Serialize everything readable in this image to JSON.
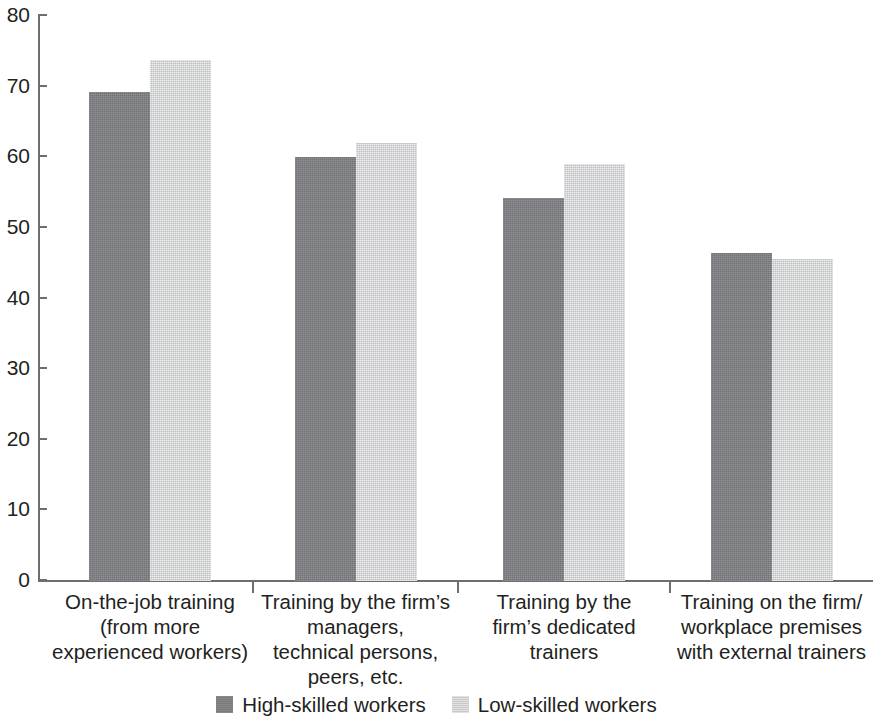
{
  "chart_data": {
    "type": "bar",
    "title": "",
    "subtitle": "",
    "xlabel": "",
    "ylabel": "",
    "ylim": [
      0,
      80
    ],
    "ytick_labels": [
      "80",
      "70",
      "60",
      "50",
      "40",
      "30",
      "20",
      "10",
      "0"
    ],
    "yticks": [
      80,
      70,
      60,
      50,
      40,
      30,
      20,
      10,
      0
    ],
    "grid": false,
    "legend_position": "bottom-center",
    "categories": [
      "On-the-job training (from more experienced workers)",
      "Training by the firm’s managers, technical persons, peers, etc.",
      "Training by the firm’s dedicated trainers",
      "Training on the firm/workplace premises with external trainers"
    ],
    "category_lines": [
      [
        "On-the-job training",
        "(from more",
        "experienced workers)"
      ],
      [
        "Training by the firm’s",
        "managers,",
        "technical persons,",
        "peers, etc."
      ],
      [
        "Training by the",
        "firm’s dedicated",
        "trainers"
      ],
      [
        "Training on the firm/",
        "workplace premises",
        "with external trainers"
      ]
    ],
    "series": [
      {
        "name": "High-skilled workers",
        "color": "#808285",
        "values": [
          69.2,
          60.0,
          54.2,
          46.5
        ]
      },
      {
        "name": "Low-skilled workers",
        "color": "#d2d3d5",
        "values": [
          73.8,
          62.0,
          59.0,
          45.6
        ]
      }
    ]
  },
  "legend": {
    "items": [
      {
        "label": "High-skilled workers",
        "swatch": "high"
      },
      {
        "label": "Low-skilled workers",
        "swatch": "low"
      }
    ]
  }
}
